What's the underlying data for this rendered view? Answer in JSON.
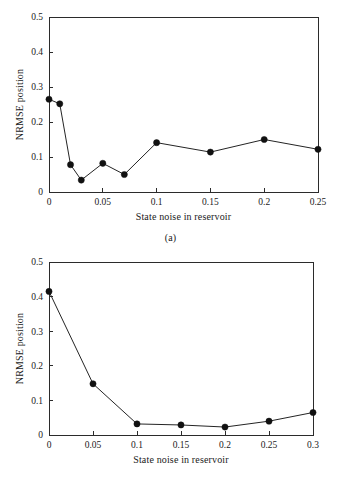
{
  "figures": [
    {
      "caption": "(a)",
      "chart_index": 0
    },
    {
      "caption": "(b)",
      "chart_index": 1
    }
  ],
  "chart_data": [
    {
      "type": "line",
      "title": "",
      "subtitle": "",
      "caption": "(a)",
      "xlabel": "State noise in reservoir",
      "ylabel": "NRMSE position",
      "xlim": [
        0,
        0.25
      ],
      "ylim": [
        0,
        0.5
      ],
      "xticks": [
        0,
        0.05,
        0.1,
        0.15,
        0.2,
        0.25
      ],
      "xtick_labels": [
        "0",
        "0.05",
        "0.1",
        "0.15",
        "0.2",
        "0.25"
      ],
      "yticks": [
        0,
        0.1,
        0.2,
        0.3,
        0.4,
        0.5
      ],
      "ytick_labels": [
        "0",
        "0.1",
        "0.2",
        "0.3",
        "0.4",
        "0.5"
      ],
      "grid": false,
      "legend": null,
      "marker": "filled-circle",
      "marker_color": "#111111",
      "line_color": "#242424",
      "x": [
        0,
        0.01,
        0.02,
        0.03,
        0.05,
        0.07,
        0.1,
        0.15,
        0.2,
        0.25
      ],
      "values": [
        0.265,
        0.252,
        0.078,
        0.034,
        0.082,
        0.05,
        0.141,
        0.114,
        0.15,
        0.122
      ]
    },
    {
      "type": "line",
      "title": "",
      "subtitle": "",
      "caption": "(b)",
      "xlabel": "State noise in reservoir",
      "ylabel": "NRMSE position",
      "xlim": [
        0,
        0.3
      ],
      "ylim": [
        0,
        0.5
      ],
      "xticks": [
        0,
        0.05,
        0.1,
        0.15,
        0.2,
        0.25,
        0.3
      ],
      "xtick_labels": [
        "0",
        "0.05",
        "0.1",
        "0.15",
        "0.2",
        "0.25",
        "0.3"
      ],
      "yticks": [
        0,
        0.1,
        0.2,
        0.3,
        0.4,
        0.5
      ],
      "ytick_labels": [
        "0",
        "0.1",
        "0.2",
        "0.3",
        "0.4",
        "0.5"
      ],
      "grid": false,
      "legend": null,
      "marker": "filled-circle",
      "marker_color": "#111111",
      "line_color": "#242424",
      "x": [
        0,
        0.05,
        0.1,
        0.15,
        0.2,
        0.25,
        0.3
      ],
      "values": [
        0.415,
        0.148,
        0.032,
        0.029,
        0.023,
        0.04,
        0.065
      ]
    }
  ]
}
